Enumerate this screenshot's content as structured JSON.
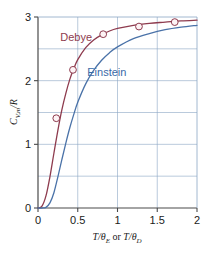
{
  "figure": {
    "background_color": "#ffffff",
    "frame_color": "#b9c4d6"
  },
  "chart_data": {
    "type": "line",
    "title": "",
    "subtitle": "",
    "xlabel": "T/θE or T/θD",
    "xlabel_parts": {
      "first_var": "T/",
      "first_theta": "θ",
      "first_sub": "E",
      "conjunction": " or ",
      "second_var": "T/",
      "second_theta": "θ",
      "second_sub": "D"
    },
    "ylabel": "CV,m/R",
    "ylabel_parts": {
      "c": "C",
      "c_sub": "V,m",
      "slash": "/",
      "r": "R"
    },
    "xlim": [
      0,
      2
    ],
    "ylim": [
      0,
      3
    ],
    "xticks": [
      0,
      0.5,
      1,
      1.5,
      2
    ],
    "xticklabels": [
      "0",
      "0.5",
      "1",
      "1.5",
      "2"
    ],
    "yticks": [
      0,
      1,
      2,
      3
    ],
    "yticklabels": [
      "0",
      "1",
      "2",
      "3"
    ],
    "grid": true,
    "grid_x_step": 0.5,
    "grid_y_step": 0.5,
    "grid_color": "#8ca6c4",
    "legend_position": "inline-annotations",
    "series": [
      {
        "name": "Debye",
        "color": "#8e3b4e",
        "label_color": "#8e3b4e",
        "label_x": 0.28,
        "label_y": 2.62,
        "x": [
          0.0,
          0.05,
          0.1,
          0.15,
          0.2,
          0.25,
          0.3,
          0.35,
          0.4,
          0.45,
          0.5,
          0.6,
          0.7,
          0.8,
          0.9,
          1.0,
          1.2,
          1.4,
          1.6,
          1.8,
          2.0
        ],
        "values": [
          0.0,
          0.03,
          0.19,
          0.49,
          0.86,
          1.22,
          1.54,
          1.8,
          2.02,
          2.19,
          2.33,
          2.52,
          2.64,
          2.72,
          2.78,
          2.82,
          2.87,
          2.9,
          2.92,
          2.94,
          2.95
        ],
        "markers_x": [
          0.23,
          0.44,
          0.82,
          1.27,
          1.72
        ],
        "markers_y": [
          1.41,
          2.17,
          2.73,
          2.85,
          2.92
        ]
      },
      {
        "name": "Einstein",
        "color": "#4a72a8",
        "label_color": "#3a6aa8",
        "label_x": 0.62,
        "label_y": 2.08,
        "x": [
          0.0,
          0.05,
          0.1,
          0.15,
          0.2,
          0.25,
          0.3,
          0.35,
          0.4,
          0.45,
          0.5,
          0.6,
          0.7,
          0.8,
          0.9,
          1.0,
          1.2,
          1.4,
          1.6,
          1.8,
          2.0
        ],
        "values": [
          0.0,
          0.0,
          0.01,
          0.08,
          0.24,
          0.49,
          0.76,
          1.02,
          1.26,
          1.47,
          1.66,
          1.95,
          2.16,
          2.32,
          2.44,
          2.53,
          2.66,
          2.74,
          2.8,
          2.84,
          2.87
        ],
        "markers_x": [],
        "markers_y": []
      }
    ],
    "marker_style": {
      "shape": "circle",
      "fill": "#fdf3f5",
      "edge_color": "#8e3b4e",
      "radius": 3.4
    }
  }
}
